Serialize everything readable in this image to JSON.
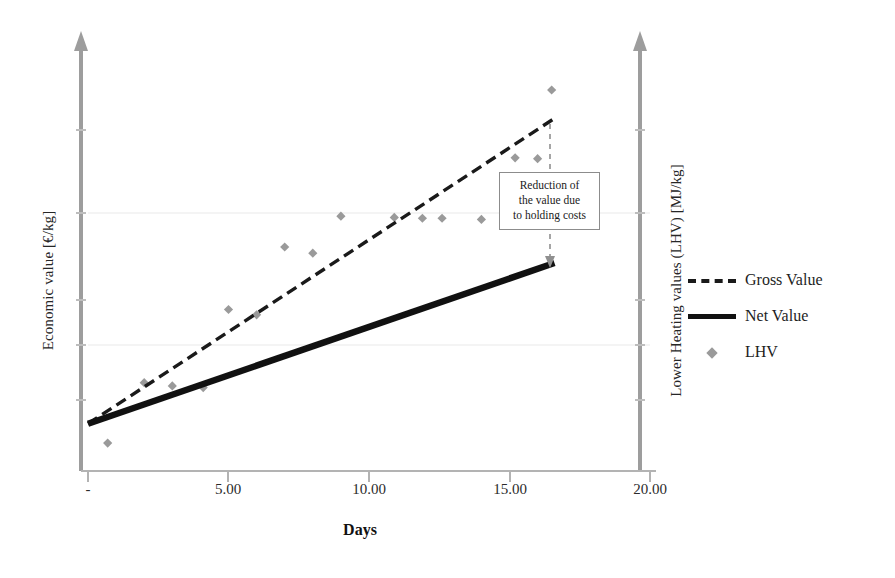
{
  "chart_data": {
    "type": "scatter",
    "title": "",
    "xlabel": "Days",
    "ylabel": "Economic value [€/kg]",
    "ylabel_right": "Lower Heating values (LHV) [MJ/kg]",
    "xlim": [
      0,
      20
    ],
    "ylim": [
      0,
      1
    ],
    "grid": false,
    "legend_position": "right",
    "xticks": [
      0,
      5,
      10,
      15,
      20
    ],
    "xticklabels": [
      "-",
      "5.00",
      "10.00",
      "15.00",
      "20.00"
    ],
    "yticklabels": [],
    "series": [
      {
        "name": "Gross Value",
        "type": "line",
        "style": "dashed",
        "color": "#1a1a1a",
        "x": [
          0,
          16.6
        ],
        "y": [
          0.115,
          0.858
        ]
      },
      {
        "name": "Net Value",
        "type": "line",
        "style": "solid",
        "color": "#111111",
        "x": [
          0,
          16.6
        ],
        "y": [
          0.115,
          0.506
        ]
      },
      {
        "name": "LHV",
        "type": "scatter",
        "marker": "diamond",
        "color": "#9a9a9a",
        "points": [
          {
            "x": 0.7,
            "y": 0.068
          },
          {
            "x": 2.0,
            "y": 0.215
          },
          {
            "x": 3.0,
            "y": 0.207
          },
          {
            "x": 4.1,
            "y": 0.203
          },
          {
            "x": 5.0,
            "y": 0.393
          },
          {
            "x": 6.0,
            "y": 0.38
          },
          {
            "x": 7.0,
            "y": 0.545
          },
          {
            "x": 8.0,
            "y": 0.53
          },
          {
            "x": 9.0,
            "y": 0.62
          },
          {
            "x": 10.9,
            "y": 0.617
          },
          {
            "x": 11.9,
            "y": 0.615
          },
          {
            "x": 12.6,
            "y": 0.615
          },
          {
            "x": 14.0,
            "y": 0.612
          },
          {
            "x": 15.2,
            "y": 0.762
          },
          {
            "x": 16.0,
            "y": 0.76
          },
          {
            "x": 16.5,
            "y": 0.927
          }
        ]
      }
    ],
    "annotations": [
      {
        "name": "reduction-callout",
        "lines": [
          "Reduction of",
          "the value due",
          "to holding costs"
        ],
        "x": 16.6
      }
    ]
  },
  "legend": {
    "items": [
      {
        "label": "Gross Value",
        "key": "dashed-line-key"
      },
      {
        "label": "Net Value",
        "key": "solid-line-key"
      },
      {
        "label": "LHV",
        "key": "diamond-marker-key"
      }
    ]
  },
  "axes": {
    "x_title": "Days",
    "y_left_title": "Economic value [€/kg]",
    "y_right_title": "Lower Heating values (LHV) [MJ/kg]",
    "x_tick_labels": [
      "-",
      "5.00",
      "10.00",
      "15.00",
      "20.00"
    ]
  },
  "colors": {
    "axis": "#9d9d9d",
    "gross": "#1a1a1a",
    "net": "#111111",
    "marker": "#9a9a9a",
    "annotation_border": "#8c8c8c",
    "text": "#1a1a1a"
  }
}
